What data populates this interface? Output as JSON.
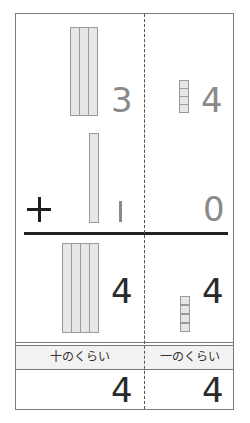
{
  "problem": {
    "operator": "+",
    "addend1": {
      "tens": 3,
      "ones": 4,
      "tens_digit": "3",
      "ones_digit": "4"
    },
    "addend2": {
      "tens": 1,
      "ones": 0,
      "tens_digit": "1",
      "ones_digit": "0"
    },
    "sum_blocks": {
      "tens": 4,
      "ones": 4,
      "tens_digit": "4",
      "ones_digit": "4"
    }
  },
  "place_labels": {
    "tens": "十のくらい",
    "ones": "一のくらい"
  },
  "answer": {
    "tens_digit": "4",
    "ones_digit": "4"
  },
  "colors": {
    "block_fill": "#e6e6e6",
    "block_border": "#9a9a9a",
    "digit_gray": "#8a8a8a",
    "digit_dark": "#2a2a2a",
    "frame": "#7a7a7a"
  }
}
